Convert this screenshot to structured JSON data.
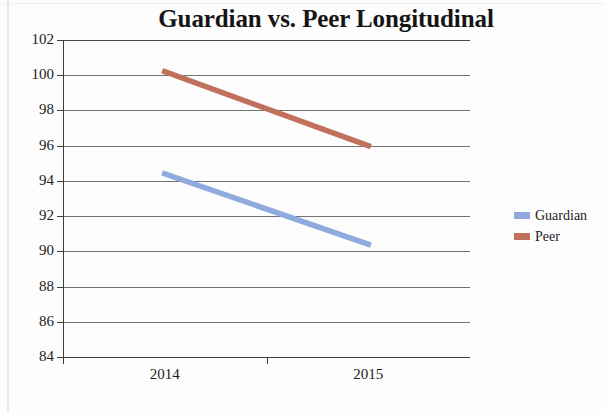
{
  "chart_data": {
    "type": "line",
    "title": "Guardian vs. Peer Longitudinal",
    "xlabel": "",
    "ylabel": "",
    "categories": [
      "2014",
      "2015"
    ],
    "series": [
      {
        "name": "Guardian",
        "values": [
          94.4,
          90.4
        ],
        "color": "#8faadc"
      },
      {
        "name": "Peer",
        "values": [
          100.2,
          96.0
        ],
        "color": "#c0705c"
      }
    ],
    "ylim": [
      84,
      102
    ],
    "yticks": [
      102,
      100,
      98,
      96,
      94,
      92,
      90,
      88,
      86,
      84
    ],
    "grid": true,
    "legend_position": "right"
  },
  "axis": {
    "y_tick_labels": [
      "102",
      "100",
      "98",
      "96",
      "94",
      "92",
      "90",
      "88",
      "86",
      "84"
    ],
    "x_tick_labels": [
      "2014",
      "2015"
    ]
  },
  "legend": {
    "items": [
      {
        "label": "Guardian",
        "color": "#8faadc"
      },
      {
        "label": "Peer",
        "color": "#c0705c"
      }
    ]
  }
}
